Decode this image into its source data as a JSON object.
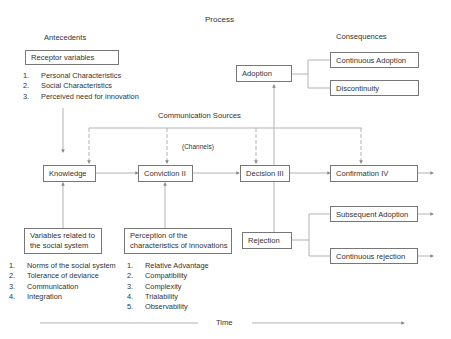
{
  "title": "Process",
  "antecedents": {
    "heading": "Antecedents",
    "box": "Receptor variables",
    "items": [
      "Personal Characteristics",
      "Social Characteristics",
      "Perceived need for innovation"
    ]
  },
  "consequences": {
    "heading": "Consequences"
  },
  "communication": {
    "label": "Communication Sources",
    "channels": "(Channels)"
  },
  "stages": {
    "knowledge": "Knowledge",
    "conviction": "Conviction II",
    "decision": "Decision III",
    "confirmation": "Confirmation IV"
  },
  "outcomes": {
    "adoption": "Adoption",
    "rejection": "Rejection",
    "continuous_adoption": "Continuous Adoption",
    "discontinuity": "Discontinuity",
    "subsequent_adoption": "Subsequent Adoption",
    "continuous_rejection": "Continuous rejection"
  },
  "social_system": {
    "box_line1": "Variables related to",
    "box_line2": "the social system",
    "items": [
      "Norms of the social system",
      "Tolerance of deviance",
      "Communication",
      "Integration"
    ]
  },
  "innovation": {
    "box_line1": "Perception of the",
    "box_line2": "characteristics of innovations",
    "items": [
      "Relative Advantage",
      "Compatibility",
      "Complexity",
      "Trialability",
      "Observability"
    ]
  },
  "time_label": "Time"
}
